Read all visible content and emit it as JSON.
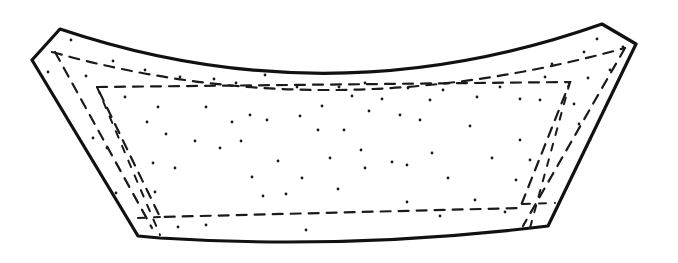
{
  "figure": {
    "colors": {
      "background": "#ffffff",
      "ink": "#111111"
    },
    "outer_outline": "M60,29 Q330,120 602,24 L636,44 L548,226 Q350,250 160,238 L138,236 L32,60 Z",
    "inner_seam_top": "M52,52 Q330,130 625,48",
    "inner_seam_left": "M55,52 L152,228",
    "inner_seam_right": "M625,48 L523,226",
    "inner_panel": "M97,87 L570,82 L520,208 L160,217 Z",
    "left_fold_line": "M97,87 L160,235",
    "right_fold_line": "M570,82 L530,228",
    "bottom_seam_left": "M138,218 L160,217",
    "bottom_seam_right": "M523,204 L555,203",
    "stipple_dots": [
      [
        71,
        40
      ],
      [
        113,
        61
      ],
      [
        145,
        70
      ],
      [
        180,
        77
      ],
      [
        214,
        79
      ],
      [
        236,
        83
      ],
      [
        265,
        75
      ],
      [
        297,
        87
      ],
      [
        48,
        72
      ],
      [
        86,
        76
      ],
      [
        125,
        97
      ],
      [
        158,
        107
      ],
      [
        206,
        107
      ],
      [
        232,
        122
      ],
      [
        250,
        115
      ],
      [
        300,
        116
      ],
      [
        267,
        120
      ],
      [
        322,
        106
      ],
      [
        339,
        87
      ],
      [
        352,
        96
      ],
      [
        365,
        83
      ],
      [
        382,
        99
      ],
      [
        400,
        115
      ],
      [
        408,
        88
      ],
      [
        430,
        100
      ],
      [
        443,
        90
      ],
      [
        477,
        97
      ],
      [
        500,
        87
      ],
      [
        520,
        99
      ],
      [
        540,
        100
      ],
      [
        545,
        77
      ],
      [
        552,
        64
      ],
      [
        584,
        52
      ],
      [
        597,
        39
      ],
      [
        623,
        47
      ],
      [
        610,
        70
      ],
      [
        588,
        78
      ],
      [
        574,
        104
      ],
      [
        579,
        124
      ],
      [
        590,
        140
      ],
      [
        93,
        138
      ],
      [
        107,
        148
      ],
      [
        147,
        122
      ],
      [
        153,
        163
      ],
      [
        166,
        134
      ],
      [
        175,
        168
      ],
      [
        195,
        141
      ],
      [
        220,
        148
      ],
      [
        241,
        141
      ],
      [
        252,
        177
      ],
      [
        278,
        161
      ],
      [
        302,
        178
      ],
      [
        318,
        130
      ],
      [
        330,
        158
      ],
      [
        344,
        130
      ],
      [
        361,
        150
      ],
      [
        369,
        111
      ],
      [
        392,
        162
      ],
      [
        407,
        165
      ],
      [
        420,
        120
      ],
      [
        432,
        153
      ],
      [
        448,
        178
      ],
      [
        470,
        126
      ],
      [
        492,
        158
      ],
      [
        520,
        140
      ],
      [
        530,
        160
      ],
      [
        116,
        193
      ],
      [
        155,
        192
      ],
      [
        178,
        227
      ],
      [
        206,
        225
      ],
      [
        263,
        196
      ],
      [
        286,
        194
      ],
      [
        306,
        230
      ],
      [
        338,
        189
      ],
      [
        365,
        168
      ],
      [
        407,
        202
      ],
      [
        440,
        216
      ],
      [
        475,
        200
      ],
      [
        505,
        212
      ],
      [
        516,
        180
      ]
    ]
  }
}
